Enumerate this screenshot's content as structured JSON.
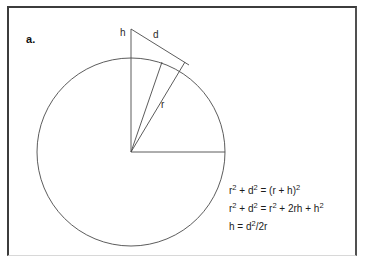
{
  "figure": {
    "panel_label": "a.",
    "background_color": "#ffffff",
    "stroke_color": "#4a4a4a",
    "text_color": "#1c1c1c",
    "border_color": "#3c3c3c"
  },
  "diagram": {
    "labels": {
      "height": "h",
      "distance": "d",
      "radius": "r"
    },
    "circle": {
      "cx": 131,
      "cy": 152,
      "r": 94
    },
    "apex": {
      "x": 131,
      "y": 29
    },
    "tangent_point": {
      "x": 185,
      "y": 62
    },
    "circle_top": {
      "x": 131,
      "y": 58
    },
    "horizontal_radius_end": {
      "x": 225,
      "y": 152
    },
    "inner_radius_end": {
      "x": 163,
      "y": 63
    }
  },
  "equations": [
    {
      "id": "eq-pythagorean",
      "lhs": "r",
      "text": "r2 + d2 = (r + h)2"
    },
    {
      "id": "eq-expanded",
      "lhs": "r",
      "text": "r2 + d2 = r2 + 2rh + h2"
    },
    {
      "id": "eq-solved",
      "lhs": "h",
      "text": "h = d2/2r"
    }
  ]
}
